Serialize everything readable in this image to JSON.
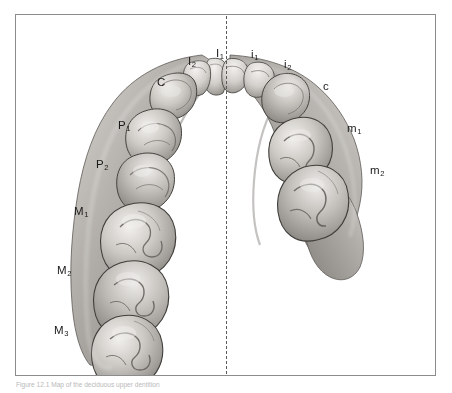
{
  "figure": {
    "type": "anatomical-illustration",
    "midline_style": "dash-dot vertical line",
    "background_color": "#ffffff",
    "frame_color": "#8c8c8c",
    "label_color": "#1a1a1a",
    "enamel_light": "#e9e7e4",
    "enamel_mid": "#b6b3ae",
    "enamel_dark": "#7d7a76",
    "outline_color": "#3a3a3a"
  },
  "caption": {
    "text": "Figure 12.1 Map of the deciduous upper dentition"
  },
  "labels": {
    "left_permanent": [
      {
        "name": "label-I2",
        "base": "I",
        "sub": "2",
        "x": 172,
        "y": 41
      },
      {
        "name": "label-I1",
        "base": "I",
        "sub": "1",
        "x": 200,
        "y": 33
      },
      {
        "name": "label-C",
        "base": "C",
        "sub": "",
        "x": 141,
        "y": 62
      },
      {
        "name": "label-P1",
        "base": "P",
        "sub": "1",
        "x": 102,
        "y": 105
      },
      {
        "name": "label-P2",
        "base": "P",
        "sub": "2",
        "x": 80,
        "y": 144
      },
      {
        "name": "label-M1",
        "base": "M",
        "sub": "1",
        "x": 58,
        "y": 191
      },
      {
        "name": "label-M2",
        "base": "M",
        "sub": "2",
        "x": 41,
        "y": 250
      },
      {
        "name": "label-M3",
        "base": "M",
        "sub": "3",
        "x": 38,
        "y": 310
      }
    ],
    "right_deciduous": [
      {
        "name": "label-i1",
        "base": "i",
        "sub": "1",
        "x": 235,
        "y": 34
      },
      {
        "name": "label-i2",
        "base": "i",
        "sub": "2",
        "x": 268,
        "y": 44
      },
      {
        "name": "label-c",
        "base": "c",
        "sub": "",
        "x": 307,
        "y": 66
      },
      {
        "name": "label-m1",
        "base": "m",
        "sub": "1",
        "x": 331,
        "y": 108
      },
      {
        "name": "label-m2",
        "base": "m",
        "sub": "2",
        "x": 354,
        "y": 150
      }
    ]
  }
}
